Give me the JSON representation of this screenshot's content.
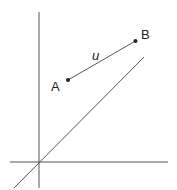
{
  "diagram": {
    "labels": {
      "point_a": "A",
      "point_b": "B",
      "segment": "u"
    },
    "colors": {
      "line": "#555555",
      "point": "#222222",
      "text": "#222222"
    }
  }
}
